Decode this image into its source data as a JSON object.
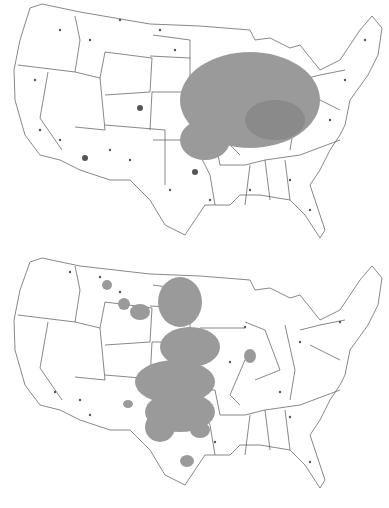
{
  "figure": {
    "panels": [
      {
        "id": "top",
        "description": "Contiguous US map with state boundaries; point observations with dense shaded cluster over Upper Midwest / Corn Belt (MN, WI, IA, IL, IN, OH, MO, eastern NE/KS)",
        "dense_region": {
          "cx": 250,
          "cy": 100,
          "rx": 75,
          "ry": 55
        },
        "secondary_clusters": [
          {
            "cx": 140,
            "cy": 108,
            "r": 5
          },
          {
            "cx": 195,
            "cy": 172,
            "r": 8
          },
          {
            "cx": 85,
            "cy": 158,
            "r": 5
          }
        ]
      },
      {
        "id": "bottom",
        "description": "Contiguous US map with state boundaries; point observations with shaded cluster over Great Plains (ND, SD, NE, KS, OK, TX panhandle)",
        "dense_region": {
          "cx": 185,
          "cy": 135,
          "rx": 45,
          "ry": 95
        },
        "secondary_clusters": [
          {
            "cx": 107,
            "cy": 33,
            "r": 5
          },
          {
            "cx": 124,
            "cy": 52,
            "r": 6
          },
          {
            "cx": 250,
            "cy": 104,
            "r": 6
          },
          {
            "cx": 187,
            "cy": 209,
            "r": 7
          },
          {
            "cx": 128,
            "cy": 152,
            "r": 5
          }
        ]
      }
    ],
    "colors": {
      "background": "#ffffff",
      "state_lines": "#555555",
      "points": "#555555",
      "shading": "#9a9a9a"
    }
  }
}
